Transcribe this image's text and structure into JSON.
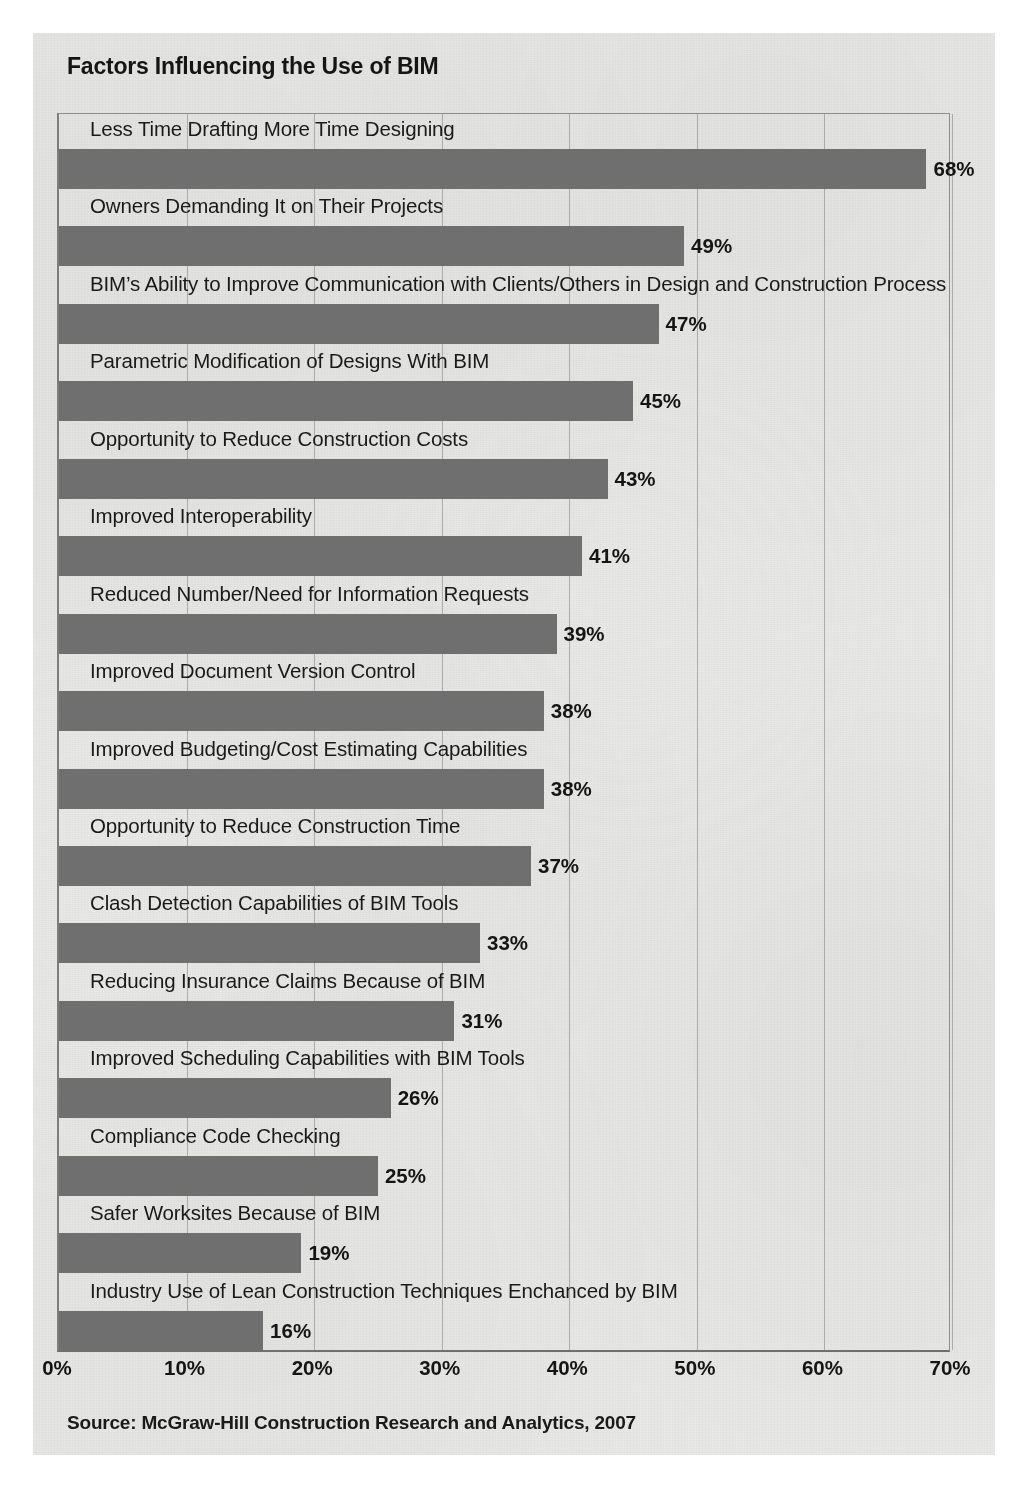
{
  "chart_title": "Factors Influencing the Use of BIM",
  "source": "Source: McGraw-Hill Construction Research and Analytics, 2007",
  "colors": {
    "bar": "#6f6f6f",
    "page": "#e8e8e6",
    "text": "#151515",
    "gridline": "#9a9a9a"
  },
  "chart_data": {
    "type": "bar",
    "orientation": "horizontal",
    "title": "Factors Influencing the Use of BIM",
    "xlabel": "",
    "ylabel": "",
    "xlim": [
      0,
      70
    ],
    "grid": true,
    "legend": false,
    "value_suffix": "%",
    "tick_labels": [
      "0%",
      "10%",
      "20%",
      "30%",
      "40%",
      "50%",
      "60%",
      "70%"
    ],
    "ticks": [
      0,
      10,
      20,
      30,
      40,
      50,
      60,
      70
    ],
    "categories": [
      "Less Time Drafting More Time Designing",
      "Owners  Demanding It on Their Projects",
      "BIM’s Ability to Improve Communication with Clients/Others in Design and Construction Process",
      "Parametric Modification of Designs With BIM",
      "Opportunity to Reduce Construction Costs",
      "Improved Interoperability",
      "Reduced Number/Need for Information Requests",
      "Improved Document Version Control",
      "Improved Budgeting/Cost Estimating Capabilities",
      "Opportunity to Reduce Construction Time",
      "Clash Detection Capabilities of BIM Tools",
      "Reducing Insurance Claims Because of BIM",
      "Improved Scheduling Capabilities with BIM Tools",
      "Compliance Code Checking",
      "Safer Worksites Because of BIM",
      "Industry Use of Lean Construction Techniques Enchanced by BIM"
    ],
    "values": [
      68,
      49,
      47,
      45,
      43,
      41,
      39,
      38,
      38,
      37,
      33,
      31,
      26,
      25,
      19,
      16
    ],
    "value_labels": [
      "68%",
      "49%",
      "47%",
      "45%",
      "43%",
      "41%",
      "39%",
      "38%",
      "38%",
      "37%",
      "33%",
      "31%",
      "26%",
      "25%",
      "19%",
      "16%"
    ]
  }
}
